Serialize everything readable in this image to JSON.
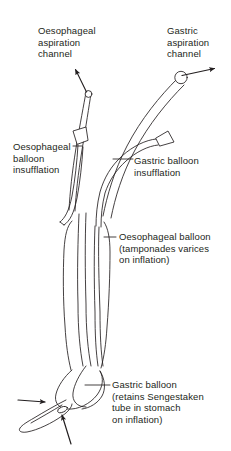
{
  "figure": {
    "type": "line-drawing",
    "ink_color": "#231f20",
    "background_color": "#ffffff"
  },
  "labels": {
    "oesophageal_aspiration": {
      "line1": "Oesophageal",
      "line2": "aspiration",
      "line3": "channel"
    },
    "gastric_aspiration": {
      "line1": "Gastric",
      "line2": "aspiration",
      "line3": "channel"
    },
    "oesophageal_insufflation": {
      "line1": "Oesophageal",
      "line2": "balloon",
      "line3": "insufflation"
    },
    "gastric_insufflation": {
      "line1": "Gastric balloon",
      "line2": "insufflation"
    },
    "oesophageal_balloon": {
      "line1": "Oesophageal balloon",
      "line2": "(tamponades varices",
      "line3": "on inflation)"
    },
    "gastric_balloon": {
      "line1": "Gastric balloon",
      "line2": "(retains Sengestaken",
      "line3": "tube in stomach",
      "line4": "on inflation)"
    }
  }
}
